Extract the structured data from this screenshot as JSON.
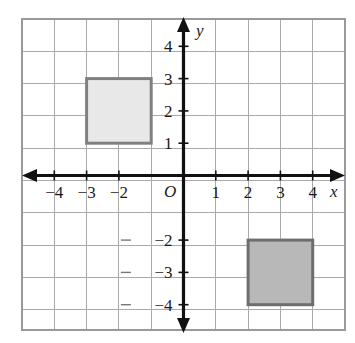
{
  "figure": {
    "origin_label": "O",
    "x_axis_label": "x",
    "y_axis_label": "y"
  },
  "chart_data": {
    "type": "scatter",
    "title": "",
    "xlabel": "x",
    "ylabel": "y",
    "xlim": [
      -5,
      5
    ],
    "ylim": [
      -5,
      5
    ],
    "grid": true,
    "legend": "none",
    "grid_step": 1,
    "x_tick_labels": [
      "-4",
      "-3",
      "-2",
      "1",
      "2",
      "3",
      "4"
    ],
    "x_tick_values": [
      -4,
      -3,
      -2,
      1,
      2,
      3,
      4
    ],
    "y_tick_labels": [
      "4",
      "3",
      "2",
      "1",
      "-2",
      "-3",
      "-4"
    ],
    "y_tick_values": [
      4,
      3,
      2,
      1,
      -2,
      -3,
      -4
    ],
    "origin_label": "O",
    "shapes": [
      {
        "name": "upper-left-square",
        "kind": "square",
        "x_range": [
          -3,
          -1
        ],
        "y_range": [
          1,
          3
        ],
        "vertices": [
          [
            -3,
            3
          ],
          [
            -1,
            3
          ],
          [
            -1,
            1
          ],
          [
            -3,
            1
          ]
        ],
        "side_length": 2,
        "fill": "#e8e8e8",
        "stroke": "#808080"
      },
      {
        "name": "lower-right-square",
        "kind": "square",
        "x_range": [
          2,
          4
        ],
        "y_range": [
          -4,
          -2
        ],
        "vertices": [
          [
            2,
            -2
          ],
          [
            4,
            -2
          ],
          [
            4,
            -4
          ],
          [
            2,
            -4
          ]
        ],
        "side_length": 2,
        "fill": "#b8b8b8",
        "stroke": "#6e6e6e"
      }
    ]
  },
  "colors": {
    "grid": "#aaaaaa",
    "axis": "#111111",
    "square_light_fill": "#e8e8e8",
    "square_light_stroke": "#808080",
    "square_dark_fill": "#b8b8b8",
    "square_dark_stroke": "#6e6e6e",
    "background": "#ffffff"
  }
}
